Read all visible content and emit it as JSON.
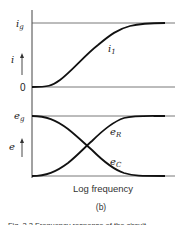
{
  "figure": {
    "top_panel": {
      "y_axis_label": "i",
      "top_level_label": "i",
      "top_level_sub": "g",
      "bottom_level_label": "0",
      "curve_label": "i",
      "curve_label_sub": "1"
    },
    "bottom_panel": {
      "y_axis_label": "e",
      "top_level_label": "e",
      "top_level_sub": "g",
      "curve_r_label": "e",
      "curve_r_sub": "R",
      "curve_c_label": "e",
      "curve_c_sub": "C"
    },
    "x_axis_label": "Log frequency",
    "panel_label": "(b)",
    "caption_partial": "Fig. 2.2  Frequency response of the circuit"
  },
  "colors": {
    "ink": "#222222",
    "axis": "#444444",
    "background": "#ffffff"
  }
}
